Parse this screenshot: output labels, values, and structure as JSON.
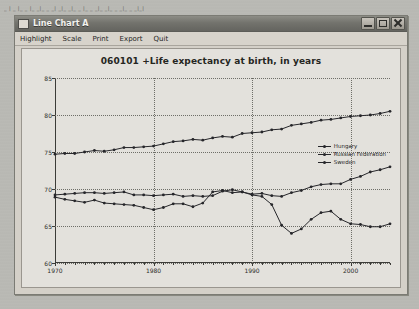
{
  "desktop": {
    "artifact_text": "_ |  _ |_ _ |_ _|_ _ _| _|_ _|_ _ |_ _ _|_ _|_ _ _|_ _ _|_|"
  },
  "window": {
    "title": "Line Chart A",
    "icon": "window-icon",
    "controls": [
      {
        "name": "minimize-button",
        "glyph": "minimize"
      },
      {
        "name": "maximize-button",
        "glyph": "maximize"
      },
      {
        "name": "close-button",
        "glyph": "close"
      }
    ]
  },
  "menu": {
    "items": [
      {
        "label": "Highlight"
      },
      {
        "label": "Scale"
      },
      {
        "label": "Print"
      },
      {
        "label": "Export"
      },
      {
        "label": "Quit"
      }
    ]
  },
  "chart_data": {
    "type": "line",
    "title": "060101 +Life expectancy at birth, in years",
    "xlabel": "",
    "ylabel": "",
    "xlim": [
      1970,
      2004
    ],
    "ylim": [
      60,
      85
    ],
    "yticks": [
      60,
      65,
      70,
      75,
      80,
      85
    ],
    "xticks": [
      1970,
      1980,
      1990,
      2000
    ],
    "xticks_minor_step": 1,
    "grid": true,
    "legend_position": "right-middle",
    "x": [
      1970,
      1971,
      1972,
      1973,
      1974,
      1975,
      1976,
      1977,
      1978,
      1979,
      1980,
      1981,
      1982,
      1983,
      1984,
      1985,
      1986,
      1987,
      1988,
      1989,
      1990,
      1991,
      1992,
      1993,
      1994,
      1995,
      1996,
      1997,
      1998,
      1999,
      2000,
      2001,
      2002,
      2003,
      2004
    ],
    "series": [
      {
        "name": "Hungary",
        "color": "#26262a",
        "values": [
          69.2,
          69.3,
          69.4,
          69.5,
          69.5,
          69.4,
          69.5,
          69.6,
          69.2,
          69.2,
          69.1,
          69.2,
          69.3,
          69.0,
          69.1,
          69.0,
          69.1,
          69.7,
          69.9,
          69.6,
          69.3,
          69.4,
          69.1,
          69.0,
          69.5,
          69.8,
          70.3,
          70.6,
          70.7,
          70.7,
          71.3,
          71.7,
          72.3,
          72.6,
          73.0
        ]
      },
      {
        "name": "Russian Federation",
        "color": "#26262a",
        "values": [
          68.9,
          68.6,
          68.4,
          68.2,
          68.5,
          68.1,
          68.0,
          67.9,
          67.8,
          67.5,
          67.2,
          67.5,
          68.0,
          68.0,
          67.6,
          68.1,
          69.6,
          69.8,
          69.5,
          69.6,
          69.2,
          69.0,
          67.9,
          65.1,
          64.0,
          64.6,
          65.9,
          66.8,
          67.0,
          65.9,
          65.3,
          65.2,
          64.9,
          64.9,
          65.3
        ]
      },
      {
        "name": "Sweden",
        "color": "#26262a",
        "values": [
          74.7,
          74.8,
          74.8,
          75.0,
          75.2,
          75.1,
          75.3,
          75.6,
          75.6,
          75.7,
          75.8,
          76.1,
          76.4,
          76.5,
          76.7,
          76.6,
          76.9,
          77.1,
          77.0,
          77.5,
          77.6,
          77.7,
          78.0,
          78.1,
          78.6,
          78.8,
          79.0,
          79.3,
          79.4,
          79.6,
          79.8,
          79.9,
          80.0,
          80.2,
          80.5
        ]
      }
    ]
  }
}
